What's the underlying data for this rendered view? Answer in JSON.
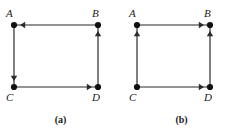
{
  "figure": {
    "style": {
      "edge_color": "#2b2b2b",
      "vertex_color": "#111111",
      "background": "#ffffff",
      "edge_width": 1.2,
      "vertex_radius": 3.1,
      "arrow_size": 5.2
    },
    "panels": [
      {
        "id": "a",
        "caption": "(a)",
        "vertices": [
          {
            "id": "A",
            "label": "A",
            "x": 14,
            "y": 25,
            "label_x": 6,
            "label_y": 8
          },
          {
            "id": "B",
            "label": "B",
            "x": 98,
            "y": 25,
            "label_x": 92,
            "label_y": 8
          },
          {
            "id": "C",
            "label": "C",
            "x": 14,
            "y": 87,
            "label_x": 6,
            "label_y": 92
          },
          {
            "id": "D",
            "label": "D",
            "x": 98,
            "y": 87,
            "label_x": 92,
            "label_y": 92
          }
        ],
        "edges": [
          {
            "id": "B-to-A",
            "from": "B",
            "to": "A",
            "direction": "left",
            "arrow_at": "A"
          },
          {
            "id": "A-to-C",
            "from": "A",
            "to": "C",
            "direction": "down",
            "arrow_at": "C"
          },
          {
            "id": "C-to-D",
            "from": "C",
            "to": "D",
            "direction": "right",
            "arrow_at": "D"
          },
          {
            "id": "D-to-B",
            "from": "D",
            "to": "B",
            "direction": "up",
            "arrow_at": "B"
          }
        ]
      },
      {
        "id": "b",
        "caption": "(b)",
        "vertices": [
          {
            "id": "A",
            "label": "A",
            "x": 16,
            "y": 25,
            "label_x": 8,
            "label_y": 8
          },
          {
            "id": "B",
            "label": "B",
            "x": 89,
            "y": 25,
            "label_x": 83,
            "label_y": 8
          },
          {
            "id": "C",
            "label": "C",
            "x": 16,
            "y": 87,
            "label_x": 8,
            "label_y": 92
          },
          {
            "id": "D",
            "label": "D",
            "x": 89,
            "y": 87,
            "label_x": 83,
            "label_y": 92
          }
        ],
        "edges": [
          {
            "id": "A-to-B",
            "from": "A",
            "to": "B",
            "direction": "right",
            "arrow_at": "B"
          },
          {
            "id": "C-to-A",
            "from": "C",
            "to": "A",
            "direction": "up",
            "arrow_at": "A"
          },
          {
            "id": "C-to-D",
            "from": "C",
            "to": "D",
            "direction": "right",
            "arrow_at": "D"
          },
          {
            "id": "D-to-B",
            "from": "D",
            "to": "B",
            "direction": "up",
            "arrow_at": "B"
          }
        ]
      }
    ]
  }
}
